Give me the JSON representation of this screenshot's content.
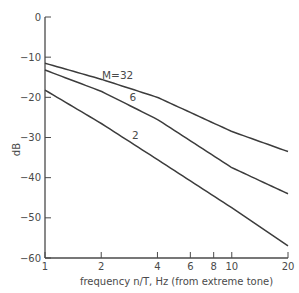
{
  "chart_data": {
    "type": "line",
    "title": "",
    "xlabel": "frequency n/T, Hz (from extreme tone)",
    "ylabel": "dB",
    "xscale": "log",
    "xlim": [
      1,
      20
    ],
    "ylim": [
      -60,
      0
    ],
    "xticks": [
      1,
      2,
      4,
      6,
      8,
      10,
      20
    ],
    "xtick_labels": [
      "1",
      "2",
      "4",
      "6",
      "8",
      "10",
      "20"
    ],
    "yticks": [
      0,
      -10,
      -20,
      -30,
      -40,
      -50,
      -60
    ],
    "ytick_labels": [
      "0",
      "-10",
      "-20",
      "-30",
      "-40",
      "-50",
      "-60"
    ],
    "grid": false,
    "legend": "none",
    "x": [
      1,
      2,
      4,
      10,
      20
    ],
    "series": [
      {
        "name": "M=32",
        "label": "M=32",
        "values": [
          -11.5,
          -15.5,
          -20,
          -28.5,
          -33.5
        ]
      },
      {
        "name": "M=6",
        "label": "6",
        "values": [
          -13.2,
          -18.5,
          -25.5,
          -37.5,
          -44
        ]
      },
      {
        "name": "M=2",
        "label": "2",
        "values": [
          -18.2,
          -26.5,
          -35.5,
          -47.5,
          -57
        ]
      }
    ],
    "annotations": [
      {
        "text": "M=32",
        "series": "M=32",
        "x": 2.2
      },
      {
        "text": "6",
        "series": "M=6",
        "x": 2.6
      },
      {
        "text": "2",
        "series": "M=2",
        "x": 2.6
      }
    ]
  }
}
